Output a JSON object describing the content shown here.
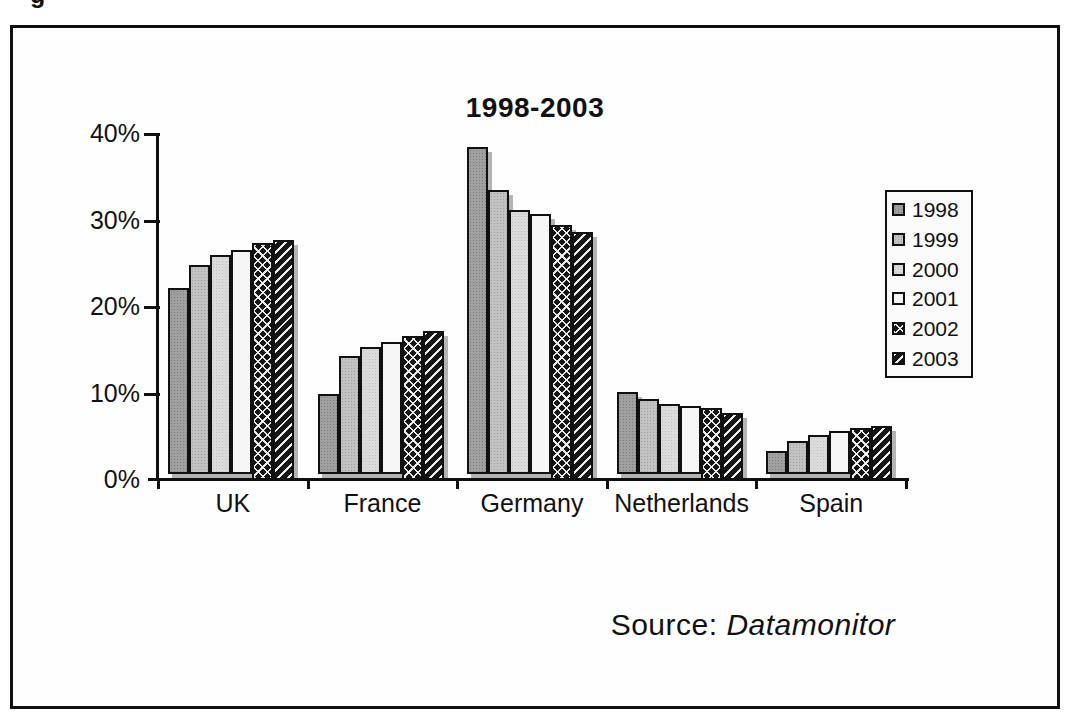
{
  "page": {
    "caption_fragment": "g"
  },
  "chart": {
    "title": "1998-2003",
    "source_prefix": "Source: ",
    "source_name": "Datamonitor"
  },
  "chart_data": {
    "type": "bar",
    "title": "1998-2003",
    "categories": [
      "UK",
      "France",
      "Germany",
      "Netherlands",
      "Spain"
    ],
    "series": [
      {
        "name": "1998",
        "pattern": "stipple-dark-gray",
        "values": [
          22.2,
          9.9,
          38.5,
          10.2,
          3.4
        ]
      },
      {
        "name": "1999",
        "pattern": "stipple-gray",
        "values": [
          24.9,
          14.3,
          33.5,
          9.4,
          4.5
        ]
      },
      {
        "name": "2000",
        "pattern": "stipple-light-gray",
        "values": [
          26.0,
          15.4,
          31.2,
          8.8,
          5.2
        ]
      },
      {
        "name": "2001",
        "pattern": "white",
        "values": [
          26.6,
          15.9,
          30.8,
          8.5,
          5.7
        ]
      },
      {
        "name": "2002",
        "pattern": "black-herringbone",
        "values": [
          27.4,
          16.6,
          29.5,
          8.3,
          6.0
        ]
      },
      {
        "name": "2003",
        "pattern": "black-diagonal",
        "values": [
          27.8,
          17.2,
          28.7,
          7.8,
          6.2
        ]
      }
    ],
    "y_ticks": [
      "0%",
      "10%",
      "20%",
      "30%",
      "40%"
    ],
    "ylim": [
      0,
      40
    ],
    "unit": "%",
    "grid": false,
    "legend_position": "right",
    "source": "Source: Datamonitor"
  },
  "colors": {
    "frame_border": "#101010",
    "bar_border": "#101010",
    "shadow": "#b4b4b4",
    "text": "#111111",
    "background": "#fefefe"
  }
}
